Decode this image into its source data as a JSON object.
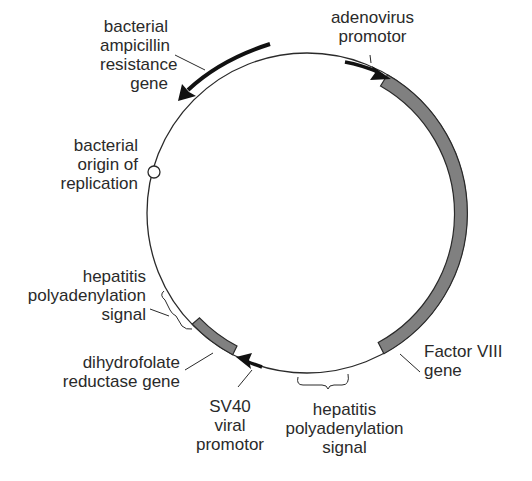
{
  "diagram": {
    "colors": {
      "backbone": "#2a2a2a",
      "gene_fill": "#808080",
      "gene_stroke": "#2a2a2a",
      "arrow": "#111111",
      "background": "#ffffff"
    },
    "labels": {
      "ampicillin": [
        "bacterial",
        "ampicillin",
        "resistance",
        "gene"
      ],
      "adenovirus": [
        "adenovirus",
        "promotor"
      ],
      "origin": [
        "bacterial",
        "origin of",
        "replication"
      ],
      "hep_polyA_left": [
        "hepatitis",
        "polyadenylation",
        "signal"
      ],
      "dhfr": [
        "dihydrofolate",
        "reductase gene"
      ],
      "sv40": [
        "SV40",
        "viral",
        "promotor"
      ],
      "factor8": [
        "Factor VIII",
        "gene"
      ],
      "hep_polyA_bottom": [
        "hepatitis",
        "polyadenylation",
        "signal"
      ]
    },
    "elements": [
      {
        "name": "bacterial ampicillin resistance gene",
        "type": "arrow",
        "direction": "counterclockwise"
      },
      {
        "name": "adenovirus promotor",
        "type": "arrow",
        "direction": "clockwise"
      },
      {
        "name": "Factor VIII gene",
        "type": "shaded-segment"
      },
      {
        "name": "hepatitis polyadenylation signal",
        "type": "bracket",
        "position": "bottom"
      },
      {
        "name": "SV40 viral promotor",
        "type": "arrow",
        "direction": "clockwise"
      },
      {
        "name": "dihydrofolate reductase gene",
        "type": "shaded-segment"
      },
      {
        "name": "hepatitis polyadenylation signal",
        "type": "bracket",
        "position": "lower-left"
      },
      {
        "name": "bacterial origin of replication",
        "type": "circle-marker"
      }
    ]
  }
}
